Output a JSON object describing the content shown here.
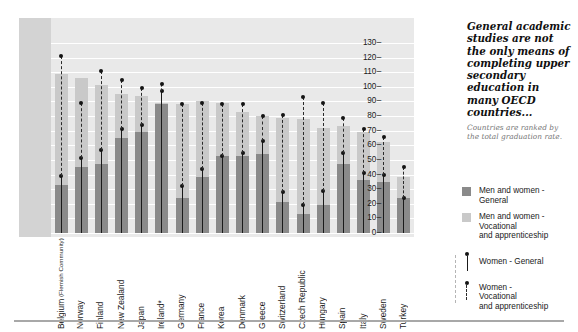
{
  "headline": "General academic studies are not the only means of completing upper secondary education in many OECD countries...",
  "subnote": "Countries are ranked by the total graduation rate.",
  "legend": {
    "items": [
      {
        "key": "men-women-general",
        "label": "Men and women - General",
        "marker": "swatch-dark",
        "color": "#8a8a8a"
      },
      {
        "key": "men-women-vocational",
        "label": "Men and women - Vocational and apprenticeship",
        "marker": "swatch-light",
        "color": "#c9c9c9"
      },
      {
        "key": "women-general",
        "label": "Women - General",
        "marker": "dot-solid-line",
        "color": "#141414"
      },
      {
        "key": "women-vocational",
        "label": "Women - Vocational and apprenticeship",
        "marker": "dot-dashed-line",
        "color": "#141414"
      }
    ]
  },
  "chart_data": {
    "type": "bar",
    "title": "",
    "xlabel": "",
    "ylabel": "",
    "ylim": [
      0,
      130
    ],
    "yticks": [
      0,
      10,
      20,
      30,
      40,
      50,
      60,
      70,
      80,
      90,
      100,
      110,
      120,
      130
    ],
    "grid": true,
    "legend_position": "right",
    "stacked": true,
    "categories": [
      "Belgium",
      "Norway",
      "Finland",
      "New Zealand",
      "Japan",
      "Ireland*",
      "Germany",
      "France",
      "Korea",
      "Denmark",
      "Greece",
      "Switzerland",
      "Czech Republic",
      "Hungary",
      "Spain",
      "Italy",
      "Sweden",
      "Turkey"
    ],
    "category_sublabels": [
      "(Flemish Community)",
      "",
      "",
      "",
      "",
      "",
      "",
      "",
      "",
      "",
      "",
      "",
      "",
      "",
      "",
      "",
      "",
      ""
    ],
    "series": [
      {
        "name": "Men and women - General",
        "color": "#8a8a8a",
        "values": [
          33,
          45,
          47,
          65,
          69,
          88,
          24,
          38,
          53,
          53,
          54,
          21,
          13,
          19,
          47,
          36,
          35,
          24
        ]
      },
      {
        "name": "Men and women - Vocational and apprenticeship",
        "color": "#c9c9c9",
        "values": [
          76,
          61,
          54,
          30,
          25,
          1,
          64,
          52,
          36,
          30,
          26,
          58,
          65,
          53,
          26,
          33,
          27,
          14
        ]
      }
    ],
    "markers": [
      {
        "name": "Women - General",
        "style": "dot-solid-line",
        "color": "#141414",
        "values": [
          39,
          51,
          57,
          71,
          74,
          97,
          32,
          44,
          53,
          55,
          63,
          28,
          19,
          29,
          55,
          41,
          40,
          24
        ]
      },
      {
        "name": "Women - Vocational and apprenticeship",
        "style": "dot-dashed-line",
        "color": "#141414",
        "values": [
          121,
          89,
          111,
          105,
          99,
          102,
          88,
          89,
          88,
          88,
          80,
          81,
          93,
          89,
          79,
          71,
          66,
          45
        ]
      }
    ],
    "totals": [
      109,
      106,
      101,
      95,
      94,
      89,
      88,
      90,
      89,
      83,
      80,
      79,
      78,
      72,
      73,
      69,
      62,
      38
    ]
  }
}
